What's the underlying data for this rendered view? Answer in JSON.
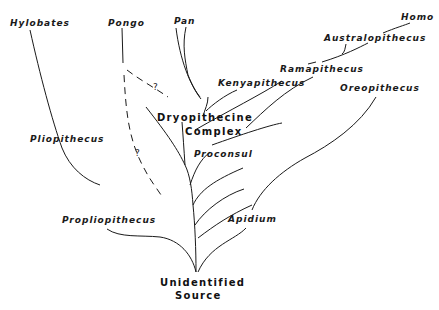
{
  "diagram": {
    "type": "phylogenetic-tree",
    "root": "Unidentified Source",
    "taxa": {
      "hylobates": "Hylobates",
      "pongo": "Pongo",
      "pan": "Pan",
      "homo": "Homo",
      "australopithecus": "Australopithecus",
      "ramapithecus": "Ramapithecus",
      "kenyapithecus": "Kenyapithecus",
      "oreopithecus": "Oreopithecus",
      "pliopithecus": "Pliopithecus",
      "proconsul": "Proconsul",
      "propliopithecus": "Propliopithecus",
      "apidium": "Apidium"
    },
    "groups": {
      "dryopithecine_line1": "Dryopithecine",
      "dryopithecine_line2": "Complex",
      "source_line1": "Unidentified",
      "source_line2": "Source"
    },
    "uncertain_marks": {
      "upper": "?",
      "lower": "?"
    },
    "edges": [
      {
        "from": "Unidentified Source",
        "to": "Propliopithecus",
        "style": "solid"
      },
      {
        "from": "Propliopithecus",
        "to": "Pliopithecus",
        "style": "solid"
      },
      {
        "from": "Pliopithecus",
        "to": "Hylobates",
        "style": "solid"
      },
      {
        "from": "Unidentified Source",
        "to": "Apidium",
        "style": "solid"
      },
      {
        "from": "Apidium",
        "to": "Oreopithecus",
        "style": "solid"
      },
      {
        "from": "Unidentified Source",
        "to": "Dryopithecine Complex",
        "style": "solid"
      },
      {
        "from": "Dryopithecine Complex",
        "to": "Proconsul",
        "style": "solid"
      },
      {
        "from": "Dryopithecine Complex",
        "to": "Kenyapithecus",
        "style": "solid"
      },
      {
        "from": "Dryopithecine Complex",
        "to": "Pan",
        "style": "solid"
      },
      {
        "from": "Kenyapithecus",
        "to": "Ramapithecus",
        "style": "solid"
      },
      {
        "from": "Ramapithecus",
        "to": "Australopithecus",
        "style": "solid"
      },
      {
        "from": "Australopithecus",
        "to": "Homo",
        "style": "solid"
      },
      {
        "from": "Dryopithecine Complex",
        "to": "Pongo",
        "style": "dashed",
        "uncertain": true
      }
    ]
  }
}
